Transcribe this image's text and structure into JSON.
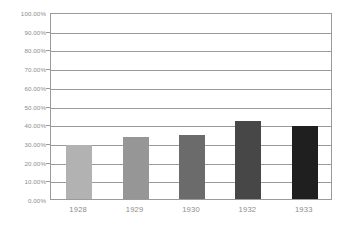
{
  "chart_data": {
    "type": "bar",
    "title": "",
    "subtitle": "",
    "xlabel": "",
    "ylabel": "",
    "categories": [
      "1928",
      "1929",
      "1930",
      "1932",
      "1933"
    ],
    "values": [
      0.2885,
      0.33,
      0.34,
      0.417,
      0.39
    ],
    "value_labels": [
      "28.85%",
      "33.00%",
      "34.00%",
      "41.70%",
      "39.00%"
    ],
    "series": [
      {
        "name": "",
        "values": [
          0.2885,
          0.33,
          0.34,
          0.417,
          0.39
        ]
      }
    ],
    "bar_colors": [
      "#b2b2b2",
      "#969696",
      "#6b6b6b",
      "#474747",
      "#1f1f1f"
    ],
    "ylim": [
      0,
      1
    ],
    "ytick_values": [
      1.0,
      0.9,
      0.8,
      0.7,
      0.6,
      0.5,
      0.4,
      0.3,
      0.2,
      0.1,
      0.0
    ],
    "ytick_labels": [
      "100.00%",
      "90.00%",
      "80.00%",
      "70.00%",
      "60.00%",
      "50.00%",
      "40.00%",
      "30.00%",
      "20.00%",
      "10.00%",
      "0.00%"
    ],
    "xtick_labels": [
      "1928",
      "1929",
      "1930",
      "1932",
      "1933"
    ],
    "grid": {
      "horizontal": true,
      "vertical": false,
      "color": "#9a9a9a"
    },
    "legend": {
      "visible": false,
      "position": "none",
      "entries": []
    },
    "axis_label_color": "#8c8c8c",
    "plot_background": "#ffffff",
    "plot_border_color": "#9a9a9a"
  }
}
